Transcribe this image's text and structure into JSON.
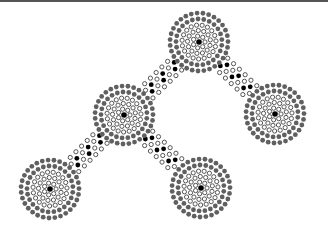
{
  "diagram": {
    "type": "dot-pattern-network",
    "width": 328,
    "height": 237,
    "colors": {
      "background": "#ffffff",
      "topbar": "#555555",
      "center_dot": "#000000",
      "open_ring_stroke": "#555555",
      "outer_ring_fill": "#606060",
      "path_filled": "#000000",
      "path_open_stroke": "#555555"
    },
    "dot_radius": 2.4,
    "nodes": [
      {
        "id": "top",
        "x": 199,
        "y": 42
      },
      {
        "id": "middle-left",
        "x": 124,
        "y": 115
      },
      {
        "id": "right",
        "x": 275,
        "y": 114
      },
      {
        "id": "bottom-left",
        "x": 50,
        "y": 189
      },
      {
        "id": "bottom-center",
        "x": 201,
        "y": 188
      }
    ],
    "rings": [
      {
        "radius": 6,
        "count": 7,
        "style": "open"
      },
      {
        "radius": 11.5,
        "count": 13,
        "style": "open"
      },
      {
        "radius": 17,
        "count": 19,
        "style": "open"
      },
      {
        "radius": 23,
        "count": 25,
        "style": "gray"
      },
      {
        "radius": 29,
        "count": 31,
        "style": "gray"
      }
    ],
    "edges": [
      {
        "from": "top",
        "to": "middle-left"
      },
      {
        "from": "top",
        "to": "right"
      },
      {
        "from": "middle-left",
        "to": "bottom-left"
      },
      {
        "from": "middle-left",
        "to": "bottom-center"
      }
    ],
    "edge_lanes": [
      {
        "offset": -8,
        "style": "open"
      },
      {
        "offset": -2.7,
        "style": "filled"
      },
      {
        "offset": 2.7,
        "style": "filled"
      },
      {
        "offset": 8,
        "style": "open"
      }
    ],
    "edge_spacing": 8
  }
}
